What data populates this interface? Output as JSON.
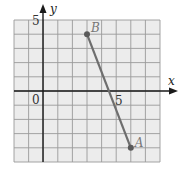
{
  "figure": {
    "x_axis_label": "x",
    "y_axis_label": "y",
    "origin_label": "0",
    "x_tick_label": "5",
    "y_tick_label": "5",
    "points": [
      {
        "name": "B",
        "x": 3,
        "y": 4
      },
      {
        "name": "A",
        "x": 6,
        "y": -4
      }
    ]
  },
  "chart_data": {
    "type": "scatter",
    "title": "",
    "xlabel": "x",
    "ylabel": "y",
    "xlim": [
      -2,
      8
    ],
    "ylim": [
      -5,
      5
    ],
    "grid": true,
    "grid_step": 1,
    "labeled_ticks": {
      "x": [
        5
      ],
      "y": [
        5
      ],
      "origin": "0"
    },
    "series": [
      {
        "name": "segment AB",
        "kind": "line_segment",
        "points": [
          {
            "label": "B",
            "x": 3,
            "y": 4
          },
          {
            "label": "A",
            "x": 6,
            "y": -4
          }
        ]
      }
    ]
  },
  "colors": {
    "grid_fill": "#ececec",
    "grid_line": "#9a9a9a",
    "axis": "#1a1a1a",
    "segment": "#6e6e6e",
    "point": "#5a5a5a",
    "point_label": "#777777"
  }
}
